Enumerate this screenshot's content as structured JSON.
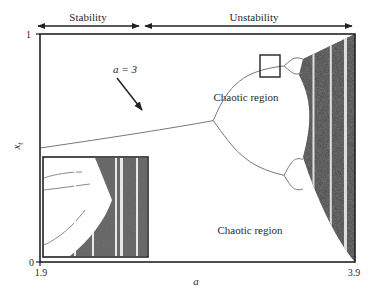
{
  "chart_data": {
    "type": "scatter",
    "title": "",
    "xlabel": "a",
    "ylabel": "x_t",
    "xlim": [
      1.9,
      3.9
    ],
    "ylim": [
      0,
      1
    ],
    "x_ticks": [
      "1.9",
      "3.9"
    ],
    "y_ticks": [
      "0",
      "1"
    ],
    "grid": false,
    "legend": "none",
    "regions": [
      {
        "label": "Stability",
        "from": 1.9,
        "to": 3.0
      },
      {
        "label": "Unstability",
        "from": 3.0,
        "to": 3.9
      }
    ],
    "annotations": [
      {
        "text": "a = 3",
        "points_to": {
          "a": 3.0,
          "x": 0.62
        }
      },
      {
        "text": "Chaotic region",
        "location": "upper-center-right"
      },
      {
        "text": "Chaotic region",
        "location": "lower-right"
      }
    ],
    "bifurcation": {
      "fixed_point_branch": {
        "a_range": [
          1.9,
          3.0
        ],
        "x_range": [
          0.5,
          0.62
        ]
      },
      "first_bifurcation_a": 3.0,
      "period_doubling_a": 3.45,
      "chaos_onset_a": 3.57,
      "chaos_max_a": 3.9
    },
    "inset": {
      "description": "Zoomed view of the boxed region of the bifurcation diagram",
      "location": "bottom-left"
    }
  },
  "labels": {
    "stability": "Stability",
    "unstability": "Unstability",
    "a_eq_3": "a = 3",
    "chaotic_upper": "Chaotic region",
    "chaotic_lower": "Chaotic region",
    "xlabel": "a",
    "ylabel_main": "x",
    "ylabel_sub": "t",
    "x_tick_min": "1.9",
    "x_tick_max": "3.9",
    "y_tick_min": "0",
    "y_tick_max": "1"
  }
}
